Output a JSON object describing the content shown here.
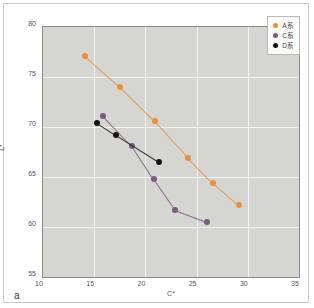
{
  "panel_label": "a",
  "legend": {
    "position": "top-right",
    "entries": [
      {
        "label": "A系",
        "color": "#e8913c",
        "marker": "circle"
      },
      {
        "label": "C系",
        "color": "#7b5b7b",
        "marker": "circle"
      },
      {
        "label": "D系",
        "color": "#141414",
        "marker": "circle"
      }
    ]
  },
  "chart_data": {
    "type": "scatter",
    "title": "",
    "xlabel": "C*",
    "ylabel": "L*",
    "xlim": [
      10,
      35
    ],
    "ylim": [
      55,
      80
    ],
    "xticks": [
      10,
      15,
      20,
      25,
      30,
      35
    ],
    "yticks": [
      55,
      60,
      65,
      70,
      75,
      80
    ],
    "grid": true,
    "lines_connect_points": true,
    "plot_background": "#d5d5d1",
    "gridline_color": "#f2f2ee",
    "series": [
      {
        "name": "A系",
        "color": "#e8913c",
        "x": [
          14.1,
          17.5,
          20.9,
          24.2,
          26.6,
          29.1
        ],
        "y": [
          77.1,
          74.0,
          70.6,
          66.9,
          64.4,
          62.2
        ]
      },
      {
        "name": "C系",
        "color": "#7b5b7b",
        "x": [
          15.9,
          18.7,
          20.8,
          22.9,
          26.0
        ],
        "y": [
          71.1,
          68.1,
          64.8,
          61.7,
          60.5
        ]
      },
      {
        "name": "D系",
        "color": "#141414",
        "x": [
          15.3,
          17.1,
          21.3
        ],
        "y": [
          70.4,
          69.2,
          66.5
        ]
      }
    ]
  }
}
